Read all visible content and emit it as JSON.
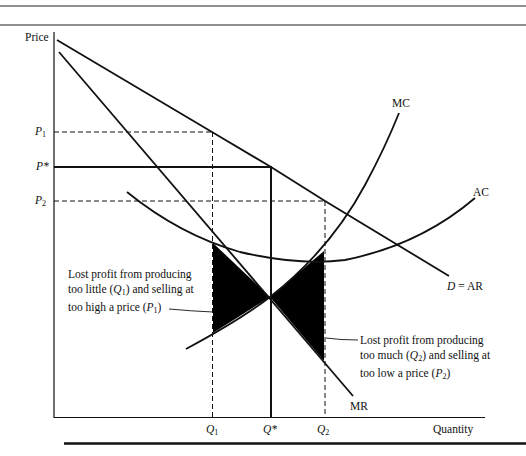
{
  "diagram": {
    "axes": {
      "y_label": "Price",
      "x_label": "Quantity"
    },
    "price_levels": [
      {
        "id": "P1",
        "symbol": "P",
        "subscript": "1",
        "y": 132
      },
      {
        "id": "Pstar",
        "symbol": "P*",
        "subscript": "",
        "y": 167
      },
      {
        "id": "P2",
        "symbol": "P",
        "subscript": "2",
        "y": 201
      }
    ],
    "quantity_levels": [
      {
        "id": "Q1",
        "symbol": "Q",
        "subscript": "1",
        "x": 212
      },
      {
        "id": "Qstar",
        "symbol": "Q*",
        "subscript": "",
        "x": 271
      },
      {
        "id": "Q2",
        "symbol": "Q",
        "subscript": "2",
        "x": 325
      }
    ],
    "curves": {
      "mc": "MC",
      "ac": "AC",
      "mr": "MR",
      "demand": {
        "d": "D",
        "eq": "= AR"
      }
    },
    "annotations": {
      "left": {
        "line1": "Lost profit from producing",
        "line2_a": "too little (",
        "line2_q": "Q",
        "line2_sub": "1",
        "line2_b": ") and selling at",
        "line3_a": "too high a price (",
        "line3_p": "P",
        "line3_sub": "1",
        "line3_b": ")"
      },
      "right": {
        "line1": "Lost profit from producing",
        "line2_a": "too much (",
        "line2_q": "Q",
        "line2_sub": "2",
        "line2_b": ") and selling at",
        "line3_a": "too low a price (",
        "line3_p": "P",
        "line3_sub": "2",
        "line3_b": ")"
      }
    },
    "colors": {
      "ink": "#111111",
      "background": "#ffffff",
      "shading": "#000000"
    }
  }
}
